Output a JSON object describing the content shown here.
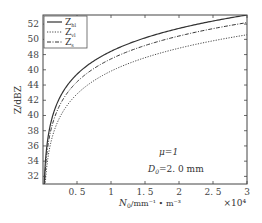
{
  "chart_data": {
    "type": "line",
    "title": "",
    "xlabel": "N_0/mm^-1 · m^-3",
    "xlabel_parts": {
      "main": "N",
      "sub": "0",
      "unit": "/mm⁻¹ • m⁻³"
    },
    "x_multiplier": "×10⁴",
    "ylabel": "Z/dBZ",
    "xlim": [
      0,
      3
    ],
    "ylim": [
      31,
      53.2
    ],
    "x_ticks": [
      0.5,
      1,
      1.5,
      2,
      2.5,
      3
    ],
    "x_tick_labels": [
      "0. 5",
      "1",
      "1. 5",
      "2",
      "2. 5",
      "3"
    ],
    "y_ticks": [
      32,
      34,
      36,
      38,
      40,
      42,
      44,
      46,
      48,
      50,
      52
    ],
    "y_tick_labels": [
      "32",
      "34",
      "36",
      "38",
      "40",
      "42",
      "44",
      "40",
      "48",
      "50",
      "52"
    ],
    "grid": false,
    "legend_position": "upper-left",
    "x": [
      0.01,
      0.02,
      0.05,
      0.1,
      0.2,
      0.3,
      0.5,
      0.75,
      1,
      1.25,
      1.5,
      1.75,
      2,
      2.25,
      2.5,
      2.75,
      3
    ],
    "series": [
      {
        "name": "Z_hl",
        "label_main": "Z",
        "label_sub": "hl",
        "style": "solid",
        "values": [
          28.4,
          31.4,
          35.4,
          38.4,
          41.4,
          43.2,
          45.4,
          47.2,
          48.4,
          49.4,
          50.2,
          50.9,
          51.4,
          51.9,
          52.4,
          52.8,
          53.2
        ]
      },
      {
        "name": "Z_vl",
        "label_main": "Z",
        "label_sub": "vl",
        "style": "dotted",
        "values": [
          25.8,
          28.8,
          32.8,
          35.8,
          38.8,
          40.6,
          42.8,
          44.6,
          45.8,
          46.8,
          47.6,
          48.3,
          48.8,
          49.3,
          49.8,
          50.2,
          50.6
        ]
      },
      {
        "name": "Z_s",
        "label_main": "Z",
        "label_sub": "s",
        "style": "dashdot",
        "values": [
          27.4,
          30.4,
          34.4,
          37.4,
          40.4,
          42.2,
          44.4,
          46.2,
          47.4,
          48.4,
          49.2,
          49.9,
          50.4,
          50.9,
          51.4,
          51.8,
          52.2
        ]
      }
    ],
    "annotations": [
      {
        "text": "μ=1",
        "x": 1.4,
        "y": 36.2
      },
      {
        "text": "D0=2.0 mm",
        "main": "D",
        "sub": "0",
        "rest": "=2. 0  mm",
        "x": 1.4,
        "y": 34.2
      }
    ]
  }
}
